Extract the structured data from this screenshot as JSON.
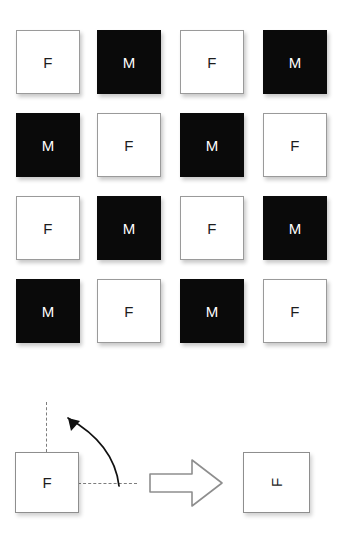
{
  "figure": {
    "background_color": "#ffffff",
    "light_card_color": "#ffffff",
    "dark_card_color": "#0a0a0a",
    "light_card_text_color": "#1d1d1d",
    "dark_card_text_color": "#ffffff",
    "outline_color": "#8e8e8e",
    "dashed_line_color": "#7d7d7d"
  },
  "grid": {
    "rows": 4,
    "columns": 4,
    "cells": [
      {
        "label": "F",
        "fill": "light"
      },
      {
        "label": "M",
        "fill": "dark"
      },
      {
        "label": "F",
        "fill": "light"
      },
      {
        "label": "M",
        "fill": "dark"
      },
      {
        "label": "M",
        "fill": "dark"
      },
      {
        "label": "F",
        "fill": "light"
      },
      {
        "label": "M",
        "fill": "dark"
      },
      {
        "label": "F",
        "fill": "light"
      },
      {
        "label": "F",
        "fill": "light"
      },
      {
        "label": "M",
        "fill": "dark"
      },
      {
        "label": "F",
        "fill": "light"
      },
      {
        "label": "M",
        "fill": "dark"
      },
      {
        "label": "M",
        "fill": "dark"
      },
      {
        "label": "F",
        "fill": "light"
      },
      {
        "label": "M",
        "fill": "dark"
      },
      {
        "label": "F",
        "fill": "light"
      }
    ]
  },
  "rotation_diagram": {
    "source_label": "F",
    "result_label": "F",
    "result_rotation_degrees": -90,
    "rotation_direction": "counterclockwise",
    "vertical_axis_icon": "dashed-vertical-axis-icon",
    "horizontal_axis_icon": "dashed-horizontal-axis-icon",
    "curved_arrow_icon": "curved-rotation-arrow-icon",
    "block_arrow_icon": "block-arrow-right-icon"
  }
}
